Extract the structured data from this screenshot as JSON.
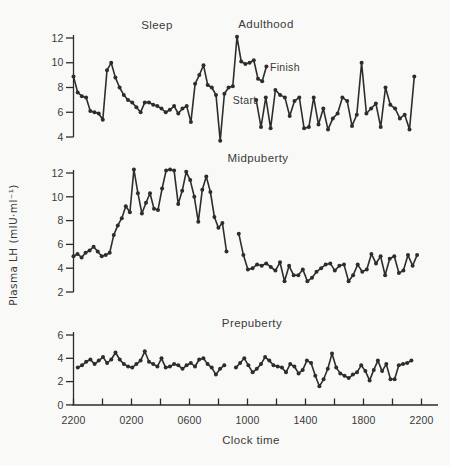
{
  "figure": {
    "background_color": "#f9f9f7",
    "line_color": "#2d2d2d",
    "text_color": "#3a3a3a"
  },
  "chart_data": {
    "type": "line",
    "xlabel": "Clock time",
    "ylabel": "Plasma LH (mIU·ml⁻¹)",
    "sleep_label": "Sleep",
    "x_axis": {
      "tick_labels": [
        "2200",
        "0200",
        "0600",
        "1000",
        "1400",
        "1800",
        "2200"
      ],
      "minor_tick_interval_hours": 2,
      "span_hours": 24,
      "grid": false
    },
    "legend": "none",
    "panels": [
      {
        "label": "Adulthood",
        "yticks": [
          4,
          6,
          8,
          10,
          12
        ],
        "ylim": [
          4,
          12
        ],
        "annotations": {
          "start": "Start",
          "finish": "Finish"
        },
        "segments": [
          {
            "name": "overnight-to-finish",
            "t_start_h": 0.0,
            "t_end_h": 13.3,
            "values": [
              8.9,
              7.6,
              7.3,
              7.2,
              6.1,
              6.0,
              5.9,
              5.4,
              9.4,
              10.0,
              8.8,
              8.0,
              7.4,
              7.0,
              6.8,
              6.4,
              6.0,
              6.8,
              6.8,
              6.6,
              6.5,
              6.3,
              6.0,
              6.2,
              6.5,
              5.9,
              6.3,
              6.5,
              5.2,
              8.3,
              9.0,
              9.8,
              8.2,
              8.0,
              7.4,
              3.7,
              7.5,
              8.0,
              8.1,
              12.1,
              10.1,
              9.9,
              10.0,
              10.2,
              8.7,
              8.5,
              9.7
            ]
          },
          {
            "name": "start-to-evening",
            "t_start_h": 12.6,
            "t_end_h": 23.5,
            "values": [
              7.0,
              4.8,
              7.2,
              4.7,
              7.8,
              7.4,
              7.2,
              5.7,
              6.9,
              7.2,
              4.7,
              4.8,
              7.2,
              5.0,
              6.3,
              4.6,
              5.5,
              5.9,
              7.2,
              6.9,
              4.9,
              5.8,
              10.0,
              5.9,
              6.3,
              6.7,
              4.8,
              8.0,
              6.6,
              6.3,
              5.5,
              5.8,
              4.6,
              8.9
            ]
          }
        ]
      },
      {
        "label": "Midpuberty",
        "yticks": [
          2,
          4,
          6,
          8,
          10,
          12
        ],
        "ylim": [
          2,
          12
        ],
        "segments": [
          {
            "name": "overnight",
            "t_start_h": 0.0,
            "t_end_h": 10.55,
            "values": [
              5.0,
              5.2,
              4.9,
              5.3,
              5.5,
              5.8,
              5.4,
              5.0,
              5.1,
              5.3,
              6.8,
              7.6,
              8.2,
              9.2,
              8.7,
              12.3,
              10.3,
              8.6,
              9.5,
              10.3,
              9.0,
              8.9,
              10.7,
              12.2,
              12.3,
              12.2,
              9.4,
              10.5,
              12.1,
              11.4,
              10.0,
              7.9,
              10.6,
              11.7,
              10.4,
              8.3,
              7.4,
              7.8,
              5.4
            ]
          },
          {
            "name": "daytime",
            "t_start_h": 11.4,
            "t_end_h": 23.7,
            "values": [
              6.9,
              5.1,
              3.9,
              4.0,
              4.3,
              4.2,
              4.4,
              4.1,
              3.8,
              4.5,
              2.9,
              4.2,
              3.4,
              3.4,
              3.9,
              2.9,
              3.2,
              3.7,
              4.0,
              4.3,
              4.4,
              3.8,
              4.2,
              4.3,
              2.9,
              3.4,
              4.3,
              3.7,
              3.9,
              5.2,
              4.4,
              5.0,
              3.4,
              4.8,
              5.0,
              3.6,
              3.8,
              5.1,
              4.2,
              5.1
            ]
          }
        ]
      },
      {
        "label": "Prepuberty",
        "yticks": [
          0,
          2,
          4,
          6
        ],
        "ylim": [
          0,
          6
        ],
        "segments": [
          {
            "name": "overnight",
            "t_start_h": 0.3,
            "t_end_h": 10.4,
            "values": [
              3.2,
              3.4,
              3.7,
              3.9,
              3.5,
              3.8,
              4.1,
              3.6,
              3.9,
              4.5,
              3.9,
              3.5,
              3.3,
              3.2,
              3.5,
              3.8,
              4.6,
              3.7,
              3.5,
              3.3,
              4.0,
              3.2,
              3.3,
              3.5,
              3.4,
              3.1,
              3.4,
              3.6,
              3.3,
              3.9,
              4.0,
              3.5,
              3.2,
              2.6,
              3.1,
              3.4
            ]
          },
          {
            "name": "daytime",
            "t_start_h": 11.2,
            "t_end_h": 23.3,
            "values": [
              3.2,
              3.6,
              4.0,
              3.4,
              2.8,
              3.1,
              3.5,
              4.1,
              3.8,
              3.4,
              3.3,
              3.2,
              2.8,
              3.5,
              3.3,
              2.7,
              3.0,
              3.8,
              3.6,
              2.5,
              1.6,
              2.2,
              3.1,
              4.4,
              3.2,
              2.7,
              2.5,
              2.3,
              2.6,
              2.8,
              3.4,
              2.9,
              2.1,
              3.0,
              3.8,
              2.9,
              3.5,
              2.2,
              2.2,
              3.4,
              3.5,
              3.6,
              3.8
            ]
          }
        ]
      }
    ]
  }
}
